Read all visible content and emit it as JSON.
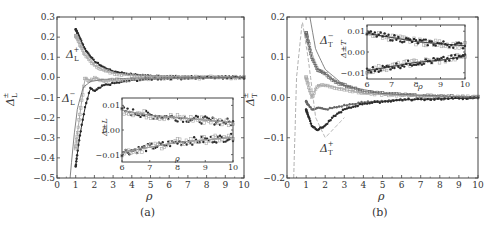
{
  "chart_data": [
    {
      "panel": "(a)",
      "type": "scatter",
      "xlabel": "ρ",
      "ylabel": "Δ±L",
      "xlim": [
        0,
        10
      ],
      "ylim": [
        -0.5,
        0.3
      ],
      "xticks": [
        "0",
        "1",
        "2",
        "3",
        "4",
        "5",
        "6",
        "7",
        "8",
        "9",
        "10"
      ],
      "yticks": [
        "0.3",
        "0.2",
        "0.1",
        "0.0",
        "-0.1",
        "-0.2",
        "-0.3",
        "-0.4",
        "-0.5"
      ],
      "annotations": [
        "Δ+L",
        "Δ−L"
      ],
      "series": [
        {
          "name": "Δ+L (dark)",
          "x": [
            1.0,
            1.2,
            1.5,
            2.0,
            2.5,
            3.0,
            4.0,
            5.0,
            6.0,
            8.0,
            10.0
          ],
          "y": [
            0.24,
            0.2,
            0.14,
            0.08,
            0.05,
            0.03,
            0.015,
            0.008,
            0.005,
            0.003,
            0.002
          ]
        },
        {
          "name": "Δ+L (light)",
          "x": [
            1.0,
            1.2,
            1.5,
            2.0,
            2.5,
            3.0,
            4.0,
            5.0,
            6.0,
            8.0,
            10.0
          ],
          "y": [
            0.21,
            0.17,
            0.11,
            0.06,
            0.035,
            0.02,
            0.01,
            0.006,
            0.004,
            0.002,
            0.001
          ]
        },
        {
          "name": "Δ−L (dark)",
          "x": [
            1.0,
            1.2,
            1.5,
            1.8,
            2.0,
            2.5,
            3.0,
            4.0,
            5.0,
            6.0,
            8.0,
            10.0
          ],
          "y": [
            -0.44,
            -0.3,
            -0.15,
            -0.05,
            -0.07,
            -0.04,
            -0.03,
            -0.015,
            -0.008,
            -0.005,
            -0.003,
            -0.002
          ]
        },
        {
          "name": "Δ−L (light)",
          "x": [
            1.0,
            1.2,
            1.5,
            1.8,
            2.0,
            2.5,
            3.0,
            4.0,
            5.0,
            6.0,
            8.0,
            10.0
          ],
          "y": [
            -0.35,
            -0.2,
            0.0,
            -0.02,
            0.0,
            -0.02,
            -0.015,
            -0.01,
            -0.006,
            -0.004,
            -0.002,
            -0.001
          ]
        },
        {
          "name": "theory",
          "x": [
            0.7,
            0.9,
            1.1,
            1.4,
            1.8,
            2.5,
            4.0,
            10.0
          ],
          "y": [
            -0.5,
            -0.3,
            -0.15,
            -0.05,
            -0.02,
            -0.01,
            -0.004,
            0.0
          ]
        }
      ],
      "inset": {
        "xlim": [
          6,
          10
        ],
        "ylim": [
          -0.013,
          0.013
        ],
        "xticks": [
          "6",
          "7",
          "8",
          "9",
          "10"
        ],
        "yticks": [
          "0.01",
          "0.00",
          "-0.01"
        ],
        "xlabel": "ρ",
        "ylabel": "Δ±L",
        "series": [
          {
            "name": "upper",
            "x": [
              6,
              7,
              8,
              9,
              10
            ],
            "y": [
              0.008,
              0.006,
              0.005,
              0.004,
              0.003
            ]
          },
          {
            "name": "lower",
            "x": [
              6,
              7,
              8,
              9,
              10
            ],
            "y": [
              -0.009,
              -0.007,
              -0.005,
              -0.004,
              -0.003
            ]
          }
        ]
      }
    },
    {
      "panel": "(b)",
      "type": "scatter",
      "xlabel": "ρ",
      "ylabel": "Δ±T",
      "xlim": [
        0,
        10
      ],
      "ylim": [
        -0.2,
        0.2
      ],
      "xticks": [
        "0",
        "1",
        "2",
        "3",
        "4",
        "5",
        "6",
        "7",
        "8",
        "9",
        "10"
      ],
      "yticks": [
        "0.2",
        "0.1",
        "0.0",
        "-0.1",
        "-0.2"
      ],
      "annotations": [
        "Δ−T",
        "Δ+T"
      ],
      "series": [
        {
          "name": "Δ−T (upper)",
          "x": [
            1.0,
            1.3,
            1.6,
            2.0,
            2.5,
            3.0,
            4.0,
            5.0,
            7.0,
            10.0
          ],
          "y": [
            0.16,
            0.1,
            0.07,
            0.06,
            0.04,
            0.03,
            0.015,
            0.01,
            0.004,
            0.001
          ]
        },
        {
          "name": "Δ−T (mid)",
          "x": [
            1.0,
            1.3,
            1.6,
            2.0,
            2.5,
            3.0,
            4.0,
            6.0,
            10.0
          ],
          "y": [
            0.05,
            0.0,
            0.03,
            0.03,
            0.025,
            0.02,
            0.01,
            0.005,
            0.001
          ]
        },
        {
          "name": "Δ+T (mid)",
          "x": [
            1.0,
            1.3,
            1.6,
            2.0,
            2.5,
            3.0,
            4.0,
            6.0,
            10.0
          ],
          "y": [
            -0.01,
            -0.03,
            -0.025,
            -0.03,
            -0.025,
            -0.02,
            -0.012,
            -0.005,
            -0.001
          ]
        },
        {
          "name": "Δ+T (lower)",
          "x": [
            1.0,
            1.3,
            1.6,
            2.0,
            2.5,
            3.0,
            4.0,
            6.0,
            10.0
          ],
          "y": [
            -0.03,
            -0.07,
            -0.08,
            -0.07,
            -0.045,
            -0.03,
            -0.015,
            -0.006,
            -0.001
          ]
        },
        {
          "name": "theory solid",
          "x": [
            1.2,
            1.5,
            2.0,
            3.0,
            5.0,
            10.0
          ],
          "y": [
            0.2,
            0.12,
            0.07,
            0.03,
            0.01,
            0.0
          ]
        },
        {
          "name": "theory dashed",
          "x": [
            0.35,
            0.5,
            0.8,
            1.1,
            1.5,
            2.0,
            3.0
          ],
          "y": [
            -0.2,
            0.05,
            0.19,
            0.1,
            -0.05,
            -0.1,
            -0.05
          ]
        }
      ],
      "inset": {
        "xlim": [
          6,
          10
        ],
        "ylim": [
          -0.013,
          0.013
        ],
        "xticks": [
          "6",
          "7",
          "8",
          "9",
          "10"
        ],
        "yticks": [
          "0.01",
          "0.00",
          "-0.01"
        ],
        "xlabel": "ρ",
        "ylabel": "Δ±T",
        "series": [
          {
            "name": "upper",
            "x": [
              6,
              7,
              8,
              9,
              10
            ],
            "y": [
              0.009,
              0.007,
              0.005,
              0.004,
              0.003
            ]
          },
          {
            "name": "lower",
            "x": [
              6,
              7,
              8,
              9,
              10
            ],
            "y": [
              -0.009,
              -0.007,
              -0.005,
              -0.004,
              -0.002
            ]
          }
        ]
      }
    }
  ],
  "labels": {
    "a": {
      "ylabel_main": "Δ",
      "ylabel_sub": "L",
      "ylabel_sup": "±",
      "xlabel": "ρ",
      "caption": "(a)",
      "ann_plus_main": "Δ",
      "ann_plus_sub": "L",
      "ann_plus_sup": "+",
      "ann_minus_main": "Δ",
      "ann_minus_sub": "L",
      "ann_minus_sup": "−",
      "inset_ylabel": "Δ±L",
      "inset_xlabel": "ρ"
    },
    "b": {
      "ylabel_main": "Δ",
      "ylabel_sub": "T",
      "ylabel_sup": "±",
      "xlabel": "ρ",
      "caption": "(b)",
      "ann_minus_main": "Δ",
      "ann_minus_sub": "T",
      "ann_minus_sup": "−",
      "ann_plus_main": "Δ",
      "ann_plus_sub": "T",
      "ann_plus_sup": "+",
      "inset_ylabel": "Δ±T",
      "inset_xlabel": "ρ"
    }
  },
  "colors": {
    "dark": "#2a2a2a",
    "mid": "#666666",
    "light": "#a8a8a8",
    "frame": "#444444"
  }
}
